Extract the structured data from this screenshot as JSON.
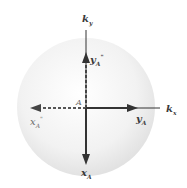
{
  "diagram": {
    "type": "k-space vector diagram",
    "sphere": {
      "center": [
        85,
        105
      ],
      "radius": 70,
      "fill": "#f0f0f0"
    },
    "axes": {
      "ky": {
        "label_main": "k",
        "label_sub": "y"
      },
      "kx": {
        "label_main": "k",
        "label_sub": "x"
      }
    },
    "origin_label": "A",
    "vectors": {
      "yA_doubleprime": {
        "main": "y",
        "sub": "A",
        "sup": "\"",
        "style": "dashed",
        "direction": "up"
      },
      "xA_doubleprime": {
        "main": "x",
        "sub": "A",
        "sup": "\"",
        "style": "dashed",
        "direction": "left"
      },
      "yA": {
        "main": "y",
        "sub": "A",
        "style": "solid",
        "direction": "right"
      },
      "xA": {
        "main": "x",
        "sub": "A",
        "style": "solid",
        "direction": "down"
      }
    },
    "colors": {
      "line": "#333333",
      "dashed": "#555555",
      "sphere": "#eeeeee"
    }
  }
}
